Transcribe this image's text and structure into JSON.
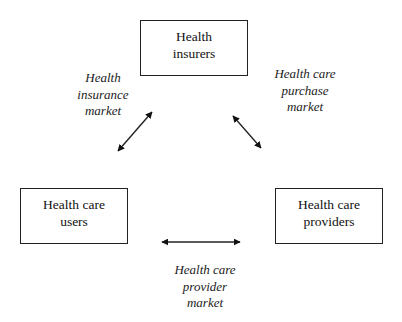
{
  "diagram": {
    "nodes": [
      {
        "id": "insurers",
        "lines": [
          "Health",
          "insurers"
        ]
      },
      {
        "id": "users",
        "lines": [
          "Health care",
          "users"
        ]
      },
      {
        "id": "providers",
        "lines": [
          "Health care",
          "providers"
        ]
      }
    ],
    "edges": [
      {
        "from": "insurers",
        "to": "users",
        "label_lines": [
          "Health",
          "insurance",
          "market"
        ],
        "direction": "bidirectional"
      },
      {
        "from": "insurers",
        "to": "providers",
        "label_lines": [
          "Health care",
          "purchase",
          "market"
        ],
        "direction": "bidirectional"
      },
      {
        "from": "users",
        "to": "providers",
        "label_lines": [
          "Health care",
          "provider",
          "market"
        ],
        "direction": "bidirectional"
      }
    ],
    "colors": {
      "stroke": "#222222",
      "background": "#ffffff"
    }
  }
}
